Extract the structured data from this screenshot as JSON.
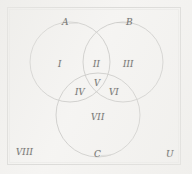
{
  "figure": {
    "kind": "venn-diagram-three-sets",
    "background_color": "#f2f1ef",
    "frame_color": "#b9b9b6",
    "stroke_color": "#9a9a97",
    "text_color": "#777775"
  },
  "sets": {
    "a_label": "A",
    "b_label": "B",
    "c_label": "C",
    "universe_label": "U"
  },
  "regions": {
    "r1": "I",
    "r2": "II",
    "r3": "III",
    "r4": "IV",
    "r5": "V",
    "r6": "VI",
    "r7": "VII",
    "r8": "VIII"
  },
  "geometry": {
    "circle_a": {
      "cx": 70,
      "cy": 62,
      "r": 40
    },
    "circle_b": {
      "cx": 123,
      "cy": 62,
      "r": 40
    },
    "circle_c": {
      "cx": 98,
      "cy": 115,
      "r": 42
    },
    "frame": {
      "x": 7,
      "y": 7,
      "width": 174,
      "height": 158
    }
  }
}
